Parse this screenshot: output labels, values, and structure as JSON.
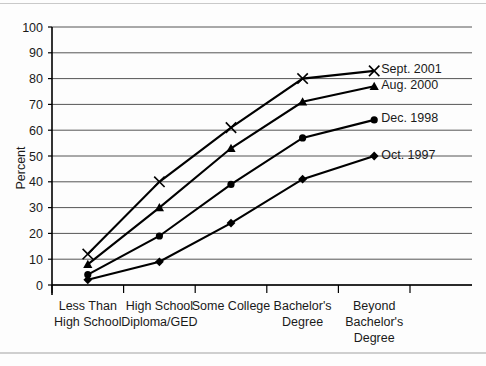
{
  "chart_data": {
    "type": "line",
    "title": "",
    "xlabel": "",
    "ylabel": "Percent",
    "ylim": [
      0,
      100
    ],
    "yticks": [
      0,
      10,
      20,
      30,
      40,
      50,
      60,
      70,
      80,
      90,
      100
    ],
    "grid": true,
    "legend_position": "right-inline-end-of-line",
    "categories": [
      "Less Than High School",
      "High School Diploma/GED",
      "Some College",
      "Bachelor's Degree",
      "Beyond Bachelor's Degree"
    ],
    "category_lines": [
      [
        "Less Than",
        "High School"
      ],
      [
        "High School",
        "Diploma/GED"
      ],
      [
        "Some College"
      ],
      [
        "Bachelor's",
        "Degree"
      ],
      [
        "Beyond",
        "Bachelor's",
        "Degree"
      ]
    ],
    "series": [
      {
        "name": "Sept. 2001",
        "marker": "x",
        "values": [
          12,
          40,
          61,
          80,
          83
        ]
      },
      {
        "name": "Aug. 2000",
        "marker": "triangle",
        "values": [
          8,
          30,
          53,
          71,
          77
        ]
      },
      {
        "name": "Dec. 1998",
        "marker": "circle",
        "values": [
          4,
          19,
          39,
          57,
          64
        ]
      },
      {
        "name": "Oct. 1997",
        "marker": "diamond",
        "values": [
          2,
          9,
          24,
          41,
          50
        ]
      }
    ],
    "colors": {
      "line": "#000000",
      "grid": "#555555",
      "axis": "#000000",
      "text": "#1a1a1a",
      "background": "#ffffff"
    }
  }
}
